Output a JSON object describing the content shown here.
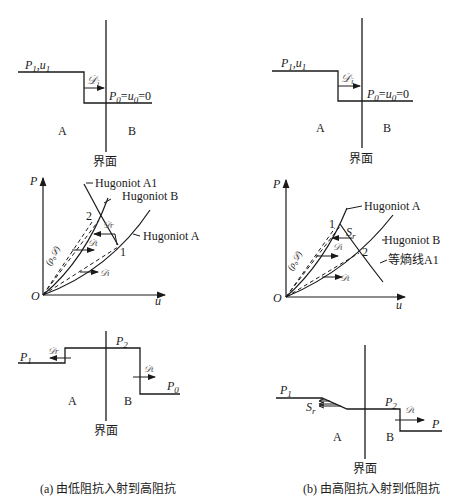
{
  "panel_a": {
    "top": {
      "left_state": "P",
      "left_state_sub": "1",
      "left_state_u": "u",
      "left_state_u_sub": "1",
      "wave_label": "𝒟",
      "wave_sub": "i",
      "right_state_P": "P",
      "right_state_P_sub": "0",
      "right_state_eq1": "=",
      "right_state_u": "u",
      "right_state_u_sub": "0",
      "right_state_eq2": "=0",
      "region_left": "A",
      "region_right": "B",
      "interface": "界面"
    },
    "middle": {
      "y_axis": "P",
      "x_axis": "u",
      "origin": "O",
      "curve_a1": "Hugoniot A1",
      "curve_b": "Hugoniot B",
      "curve_a": "Hugoniot A",
      "point_1": "1",
      "point_2": "2",
      "rayleigh_label": "(ρ₀𝒟)",
      "wave_r": "𝒟r",
      "wave_t": "𝒟t",
      "wave_i": "𝒟i"
    },
    "bottom": {
      "p1": "P",
      "p1_sub": "1",
      "p2": "P",
      "p2_sub": "2",
      "p0": "P",
      "p0_sub": "0",
      "wave_r": "𝒟r",
      "wave_t": "𝒟t",
      "region_left": "A",
      "region_right": "B",
      "interface": "界面"
    },
    "caption": "(a) 由低阻抗入射到高阻抗"
  },
  "panel_b": {
    "top": {
      "left_state": "P",
      "left_state_sub": "1",
      "left_state_u": "u",
      "left_state_u_sub": "1",
      "wave_label": "𝒟",
      "wave_sub": "i",
      "right_state_P": "P",
      "right_state_P_sub": "0",
      "right_state_eq1": "=",
      "right_state_u": "u",
      "right_state_u_sub": "0",
      "right_state_eq2": "=0",
      "region_left": "A",
      "region_right": "B",
      "interface": "界面"
    },
    "middle": {
      "y_axis": "P",
      "x_axis": "u",
      "origin": "O",
      "curve_a": "Hugoniot A",
      "curve_b": "Hugoniot B",
      "isentrope": "等熵线A1",
      "point_1": "1",
      "point_2": "2",
      "rarefaction": "S",
      "rarefaction_sub": "r",
      "rayleigh_label": "(ρ₀𝒟)",
      "wave_i": "𝒟i",
      "wave_t": "𝒟t"
    },
    "bottom": {
      "p1": "P",
      "p1_sub": "1",
      "p2": "P",
      "p2_sub": "2",
      "p": "P",
      "rarefaction": "S",
      "rarefaction_sub": "r",
      "wave_t": "𝒟t",
      "region_left": "A",
      "region_right": "B",
      "interface": "界面"
    },
    "caption": "(b) 由高阻抗入射到低阻抗"
  }
}
